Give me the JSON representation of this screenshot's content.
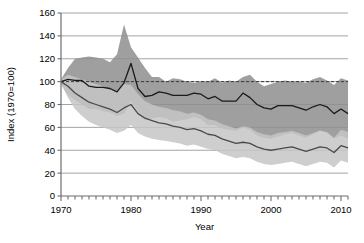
{
  "chart_data": {
    "type": "area",
    "title": "",
    "subtitle": "",
    "xlabel": "Year",
    "ylabel": "Index (1970=100)",
    "xlim": [
      1970,
      2011
    ],
    "ylim": [
      0,
      160
    ],
    "xticks": [
      1970,
      1980,
      1990,
      2000,
      2010
    ],
    "xtick_labels": [
      "1970",
      "1980",
      "1990",
      "2000",
      "2010"
    ],
    "minor_xtick_interval": 1,
    "yticks": [
      0,
      20,
      40,
      60,
      80,
      100,
      120,
      140,
      160
    ],
    "ytick_labels": [
      "0",
      "20",
      "40",
      "60",
      "80",
      "100",
      "120",
      "140",
      "160"
    ],
    "grid": "horizontal",
    "legend": "none",
    "reference_line": {
      "value": 100,
      "style": "dashed",
      "color": "#3a3a3a",
      "label": "1970 baseline = 100"
    },
    "x": [
      1970,
      1971,
      1972,
      1973,
      1974,
      1975,
      1976,
      1977,
      1978,
      1979,
      1980,
      1981,
      1982,
      1983,
      1984,
      1985,
      1986,
      1987,
      1988,
      1989,
      1990,
      1991,
      1992,
      1993,
      1994,
      1995,
      1996,
      1997,
      1998,
      1999,
      2000,
      2001,
      2002,
      2003,
      2004,
      2005,
      2006,
      2007,
      2008,
      2009,
      2010,
      2011
    ],
    "series": [
      {
        "name": "Upper index series",
        "line_color": "#1a1a1a",
        "band_color": "#8e8e8e",
        "values": [
          100,
          102,
          101,
          101,
          96,
          95,
          95,
          94,
          91,
          99,
          116,
          94,
          87,
          88,
          91,
          90,
          88,
          88,
          88,
          90,
          89,
          85,
          87,
          83,
          83,
          83,
          90,
          86,
          80,
          77,
          76,
          79,
          79,
          79,
          77,
          75,
          78,
          80,
          78,
          72,
          76,
          72
        ],
        "band_upper": [
          102,
          112,
          120,
          121,
          122,
          121,
          120,
          117,
          124,
          150,
          130,
          121,
          112,
          104,
          104,
          100,
          103,
          102,
          100,
          99,
          100,
          100,
          103,
          99,
          101,
          100,
          104,
          106,
          100,
          96,
          98,
          100,
          101,
          100,
          100,
          99,
          102,
          104,
          101,
          97,
          103,
          101
        ],
        "band_lower": [
          98,
          88,
          84,
          80,
          76,
          76,
          74,
          73,
          70,
          72,
          83,
          74,
          66,
          68,
          69,
          68,
          65,
          66,
          67,
          69,
          67,
          62,
          62,
          59,
          58,
          57,
          60,
          58,
          53,
          51,
          50,
          52,
          54,
          55,
          53,
          51,
          54,
          57,
          55,
          50,
          53,
          50
        ]
      },
      {
        "name": "Lower index series",
        "line_color": "#4a4a4a",
        "band_color": "#c6c6c6",
        "values": [
          100,
          96,
          90,
          86,
          82,
          80,
          78,
          76,
          73,
          77,
          80,
          72,
          68,
          66,
          64,
          63,
          61,
          60,
          58,
          59,
          57,
          54,
          53,
          50,
          48,
          46,
          47,
          46,
          43,
          41,
          40,
          41,
          42,
          43,
          41,
          39,
          41,
          43,
          42,
          38,
          44,
          42
        ],
        "band_upper": [
          102,
          106,
          104,
          102,
          100,
          98,
          96,
          93,
          92,
          98,
          97,
          89,
          83,
          80,
          78,
          77,
          75,
          74,
          72,
          73,
          71,
          67,
          66,
          63,
          61,
          59,
          61,
          60,
          56,
          54,
          53,
          55,
          56,
          57,
          55,
          53,
          55,
          57,
          56,
          51,
          58,
          56
        ],
        "band_lower": [
          98,
          86,
          76,
          70,
          65,
          62,
          60,
          58,
          55,
          57,
          62,
          55,
          52,
          50,
          49,
          48,
          47,
          46,
          44,
          45,
          43,
          41,
          40,
          37,
          35,
          33,
          34,
          33,
          30,
          28,
          27,
          28,
          29,
          30,
          28,
          26,
          28,
          30,
          29,
          25,
          31,
          29
        ]
      }
    ]
  }
}
